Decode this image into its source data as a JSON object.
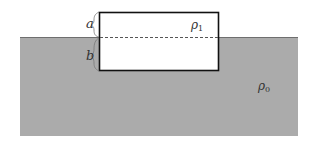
{
  "diagram": {
    "type": "buoyancy-floating-block",
    "fluid": {
      "label": "ρ",
      "subscript": "0",
      "color": "#ababab"
    },
    "block": {
      "label": "ρ",
      "subscript": "1",
      "fill": "#ffffff",
      "stroke": "#111111"
    },
    "dimensions": {
      "above_surface": "a",
      "below_surface": "b"
    },
    "waterline": {
      "style": "dashed",
      "color": "#555555"
    }
  }
}
